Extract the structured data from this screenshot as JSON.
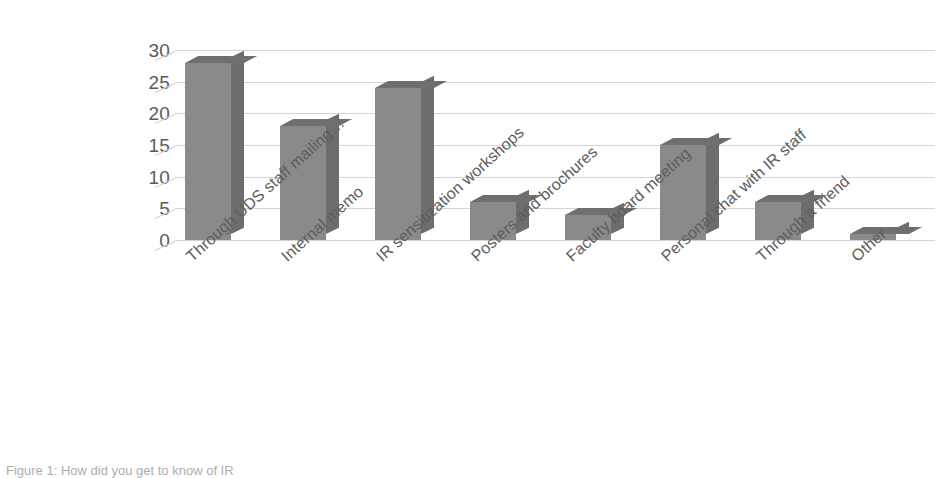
{
  "chart_data": {
    "type": "bar",
    "title": "",
    "xlabel": "",
    "ylabel": "",
    "ylim": [
      0,
      30
    ],
    "grid": true,
    "legend": "none",
    "style": "3d-column",
    "categories": [
      "Through UDS staff mailing…",
      "Internal memo",
      "IR sensitization workshops",
      "Posters and brochures",
      "Faculty board meeting",
      "Personal chat with IR staff",
      "Through a friend",
      "Other"
    ],
    "values": [
      28,
      18,
      24,
      6,
      4,
      15,
      6,
      1
    ],
    "ytick_labels": [
      "0",
      "5",
      "10",
      "15",
      "20",
      "25",
      "30"
    ],
    "ytick_values": [
      0,
      5,
      10,
      15,
      20,
      25,
      30
    ],
    "colors": {
      "bar_front": "#8a8a8a",
      "bar_side": "#6d6d6d",
      "bar_top": "#6f6f6f",
      "gridline": "#d4d4d4",
      "tick_text": "#5a5a5a",
      "category_text": "#5d5d5d",
      "background": "#ffffff"
    }
  },
  "caption": {
    "text": "Figure 1: How did you get to know of IR"
  }
}
